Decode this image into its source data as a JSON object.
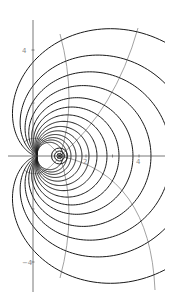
{
  "chart_data": {
    "type": "line",
    "title": "",
    "xlabel": "",
    "ylabel": "",
    "xlim": [
      -0.6,
      5.0
    ],
    "ylim": [
      -5.0,
      5.0
    ],
    "grid": false,
    "x_ticks": [
      {
        "value": 2,
        "label": "2"
      },
      {
        "value": 3,
        "label": ""
      },
      {
        "value": 4,
        "label": "4"
      }
    ],
    "y_ticks": [
      {
        "value": 4,
        "label": "4"
      },
      {
        "value": 2,
        "label": ""
      },
      {
        "value": -2,
        "label": ""
      },
      {
        "value": -4,
        "label": "-4"
      }
    ],
    "cusp_point": [
      0.15,
      0
    ],
    "focus_point": [
      1.0,
      0
    ],
    "black_curves": {
      "color": "#1a1a1a",
      "cardioid_k_px": [
        13,
        15,
        17,
        19.5,
        22.5,
        26,
        30,
        35,
        41,
        48,
        57,
        67,
        79,
        98
      ],
      "focus_circles_r_px": [
        2.5,
        5,
        8
      ]
    },
    "gray_curves": {
      "color": "#8a8a8a",
      "paths_px": [
        [
          [
            60,
            156
          ],
          [
            78,
            100
          ],
          [
            60,
            34
          ]
        ],
        [
          [
            60,
            156
          ],
          [
            115,
            110
          ],
          [
            138,
            28
          ]
        ],
        [
          [
            60,
            156
          ],
          [
            150,
            175
          ],
          [
            155,
            290
          ]
        ],
        [
          [
            60,
            156
          ],
          [
            78,
            212
          ],
          [
            60,
            278
          ]
        ],
        [
          [
            60,
            156
          ],
          [
            40,
            130
          ],
          [
            24,
            142
          ]
        ],
        [
          [
            60,
            156
          ],
          [
            40,
            182
          ],
          [
            24,
            170
          ]
        ]
      ]
    }
  },
  "layout": {
    "origin_px": [
      33,
      156
    ],
    "unit_px": 26.5,
    "clip_right_px": 165,
    "axis_color": "#555555"
  }
}
